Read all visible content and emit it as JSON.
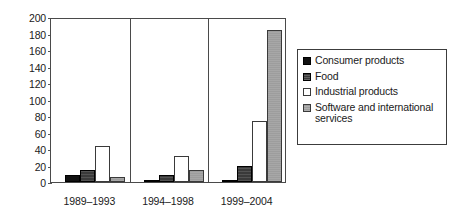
{
  "chart_data": {
    "type": "bar",
    "title": "",
    "xlabel": "",
    "ylabel": "",
    "ylim": [
      0,
      200
    ],
    "ytick_step": 20,
    "yticks": [
      "200",
      "180",
      "160",
      "140",
      "120",
      "100",
      "80",
      "60",
      "40",
      "20",
      "0"
    ],
    "grid": false,
    "legend_position": "right",
    "categories": [
      "1989–1993",
      "1994–1998",
      "1999–2004"
    ],
    "series": [
      {
        "name": "Consumer products",
        "color": "#111111",
        "values": [
          8,
          3,
          2
        ]
      },
      {
        "name": "Food",
        "color": "#3a3a3a",
        "values": [
          14,
          9,
          20
        ]
      },
      {
        "name": "Industrial products",
        "color": "#ffffff",
        "values": [
          44,
          31,
          74
        ]
      },
      {
        "name": "Software and international services",
        "color": "#9d9d9d",
        "values": [
          6,
          15,
          184
        ]
      }
    ]
  },
  "legend": {
    "items": [
      {
        "label": "Consumer products",
        "swatch": "consumer"
      },
      {
        "label": "Food",
        "swatch": "food"
      },
      {
        "label": "Industrial products",
        "swatch": "industrial"
      },
      {
        "label": "Software and international services",
        "swatch": "software"
      }
    ]
  }
}
